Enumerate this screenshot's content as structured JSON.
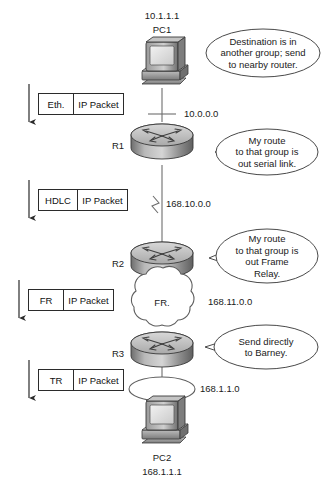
{
  "diagram": {
    "stroke_color": "#2b2b2b",
    "text_color": "#1a1a1a"
  },
  "hosts": [
    {
      "name": "PC1",
      "address": "10.1.1.1",
      "icon": "desktop-pc-icon",
      "label_position": "above"
    },
    {
      "name": "PC2",
      "address": "168.1.1.1",
      "icon": "desktop-pc-icon",
      "label_position": "below"
    }
  ],
  "routers": [
    {
      "name": "R1",
      "icon": "router-icon"
    },
    {
      "name": "R2",
      "icon": "router-icon"
    },
    {
      "name": "R3",
      "icon": "router-icon"
    }
  ],
  "networks": [
    {
      "id": "net-10",
      "label": "10.0.0.0",
      "media": "ethernet"
    },
    {
      "id": "net-168-10",
      "label": "168.10.0.0",
      "media": "serial"
    },
    {
      "id": "net-168-11",
      "label": "168.11.0.0",
      "media": "frame-relay"
    },
    {
      "id": "net-168-1-1",
      "label": "168.1.1.0",
      "media": "token-ring"
    }
  ],
  "cloud": {
    "label": "FR.",
    "icon": "frame-relay-cloud-icon"
  },
  "packets": [
    {
      "header": "Eth.",
      "payload": "IP Packet"
    },
    {
      "header": "HDLC",
      "payload": "IP Packet"
    },
    {
      "header": "FR",
      "payload": "IP Packet"
    },
    {
      "header": "TR",
      "payload": "IP Packet"
    }
  ],
  "callouts": [
    {
      "id": "callout-pc1",
      "speaker": "PC1",
      "lines": [
        "Destination is in",
        "another group; send",
        "to nearby router."
      ]
    },
    {
      "id": "callout-r1",
      "speaker": "R1",
      "lines": [
        "My route",
        "to that group is",
        "out serial link."
      ]
    },
    {
      "id": "callout-r2",
      "speaker": "R2",
      "lines": [
        "My route",
        "to that group is",
        "out Frame",
        "Relay."
      ]
    },
    {
      "id": "callout-r3",
      "speaker": "R3",
      "lines": [
        "Send directly",
        "to Barney."
      ]
    }
  ],
  "flow_arrows": [
    {
      "id": "flow-arrow-1"
    },
    {
      "id": "flow-arrow-2"
    },
    {
      "id": "flow-arrow-3"
    },
    {
      "id": "flow-arrow-4"
    }
  ]
}
